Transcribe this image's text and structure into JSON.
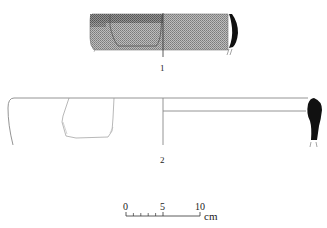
{
  "figure": {
    "type": "archaeological pottery drawing",
    "colors": {
      "ink": "#1a1a1a",
      "line": "#8a8a8a",
      "hatch": "#9a9a9a",
      "background": "#ffffff"
    }
  },
  "vessels": [
    {
      "number": "1",
      "description": "hatched rim fragment with black section profile"
    },
    {
      "number": "2",
      "description": "wide shallow vessel outline with black section profile"
    }
  ],
  "scale_bar": {
    "labels": [
      "0",
      "5",
      "10"
    ],
    "unit": "cm",
    "minor_ticks": 5
  }
}
